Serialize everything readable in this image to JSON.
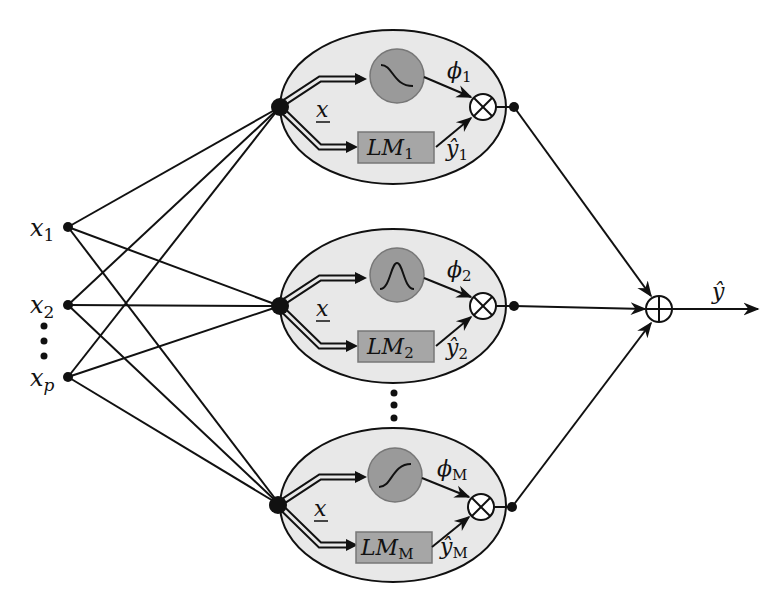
{
  "diagram": {
    "type": "local-model-network",
    "inputs": [
      {
        "label": "x",
        "sub": "1"
      },
      {
        "label": "x",
        "sub": "2"
      },
      {
        "label": "x",
        "sub": "p"
      }
    ],
    "input_ellipsis": "⋮",
    "neuron_ellipsis": "⋮",
    "neurons": [
      {
        "activation_shape": "sigmoid-decreasing",
        "phi": "ϕ",
        "phi_sub": "1",
        "lm": "LM",
        "lm_sub": "1",
        "yhat": "ŷ",
        "yhat_sub": "1",
        "x_label": "x"
      },
      {
        "activation_shape": "gaussian",
        "phi": "ϕ",
        "phi_sub": "2",
        "lm": "LM",
        "lm_sub": "2",
        "yhat": "ŷ",
        "yhat_sub": "2",
        "x_label": "x"
      },
      {
        "activation_shape": "sigmoid-increasing",
        "phi": "ϕ",
        "phi_sub": "M",
        "lm": "LM",
        "lm_sub": "M",
        "yhat": "ŷ",
        "yhat_sub": "M",
        "x_label": "x"
      }
    ],
    "multiply_symbol": "⊗",
    "sum_symbol": "⊕",
    "output": {
      "label": "ŷ"
    },
    "colors": {
      "ellipse_fill": "#e8e8e8",
      "activation_fill": "#9a9a9a",
      "lm_fill": "#a6a6a6",
      "stroke": "#111111"
    }
  }
}
